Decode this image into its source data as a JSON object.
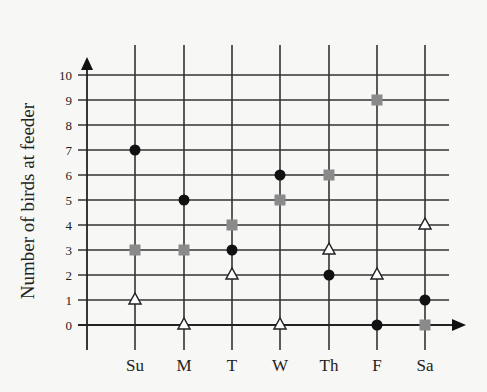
{
  "chart_data": {
    "type": "scatter",
    "title": "",
    "xlabel": "",
    "ylabel": "Number of birds at feeder",
    "categories": [
      "Su",
      "M",
      "T",
      "W",
      "Th",
      "F",
      "Sa"
    ],
    "yticks": [
      0,
      1,
      2,
      3,
      4,
      5,
      6,
      7,
      8,
      9,
      10
    ],
    "ylim": [
      0,
      10
    ],
    "grid": true,
    "legend": null,
    "series": [
      {
        "name": "black-circle",
        "marker": "circle",
        "color": "#111111",
        "values": [
          7,
          5,
          3,
          6,
          2,
          0,
          1
        ]
      },
      {
        "name": "gray-square",
        "marker": "square",
        "color": "#8a8a8a",
        "values": [
          3,
          3,
          4,
          5,
          6,
          9,
          0
        ]
      },
      {
        "name": "open-triangle",
        "marker": "triangle",
        "color": "#ffffff",
        "values": [
          1,
          0,
          2,
          0,
          3,
          2,
          4
        ]
      }
    ]
  },
  "colors": {
    "axis": "#222222",
    "grid": "#333333",
    "background": "#f7f7f5"
  }
}
